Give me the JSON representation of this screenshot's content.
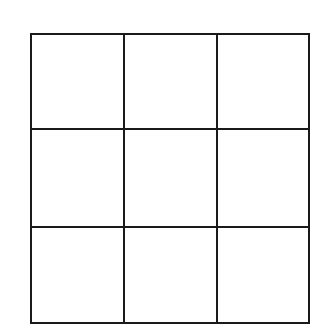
{
  "board": {
    "rows": 3,
    "cols": 3,
    "line_color": "#1a1a1a",
    "background": "#ffffff",
    "cells": [
      [
        "",
        "",
        ""
      ],
      [
        "",
        "",
        ""
      ],
      [
        "",
        "",
        ""
      ]
    ]
  }
}
